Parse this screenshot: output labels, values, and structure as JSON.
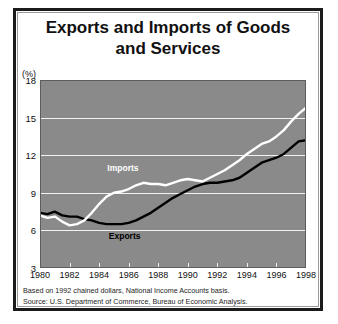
{
  "title": {
    "line1": "Exports and Imports of Goods",
    "line2": "and Services"
  },
  "axis": {
    "unit_label": "(%)",
    "y_ticks": [
      "3",
      "6",
      "9",
      "12",
      "15",
      "18"
    ],
    "x_ticks": [
      "1980",
      "1982",
      "1984",
      "1986",
      "1988",
      "1990",
      "1992",
      "1994",
      "1996",
      "1998"
    ]
  },
  "labels": {
    "imports": "Imports",
    "exports": "Exports"
  },
  "footnotes": [
    "Based on 1992 chained dollars, National Income Accounts basis.",
    "Source: U.S. Department of Commerce, Bureau of Economic Analysis."
  ],
  "colors": {
    "plot_background": "#8a8a8a",
    "gridline": "#f2f2f2",
    "imports_line": "#ffffff",
    "exports_line": "#000000",
    "frame": "#1b1b1b",
    "text": "#111111"
  },
  "chart_data": {
    "type": "line",
    "title": "Exports and Imports of Goods and Services",
    "xlabel": "",
    "ylabel": "(%)",
    "xlim": [
      1980,
      1998
    ],
    "ylim": [
      3,
      18
    ],
    "grid": true,
    "legend": "inline-annotations",
    "x": [
      1980,
      1980.5,
      1981,
      1981.5,
      1982,
      1982.5,
      1983,
      1983.5,
      1984,
      1984.5,
      1985,
      1985.5,
      1986,
      1986.5,
      1987,
      1987.5,
      1988,
      1988.5,
      1989,
      1989.5,
      1990,
      1990.5,
      1991,
      1991.5,
      1992,
      1992.5,
      1993,
      1993.5,
      1994,
      1994.5,
      1995,
      1995.5,
      1996,
      1996.5,
      1997,
      1997.5,
      1998
    ],
    "series": [
      {
        "name": "Exports",
        "color": "#000000",
        "values": [
          7.4,
          7.3,
          7.5,
          7.2,
          7.1,
          7.1,
          6.9,
          6.8,
          6.6,
          6.5,
          6.5,
          6.5,
          6.6,
          6.8,
          7.1,
          7.4,
          7.8,
          8.2,
          8.6,
          8.9,
          9.2,
          9.5,
          9.7,
          9.8,
          9.8,
          9.9,
          10.0,
          10.2,
          10.6,
          11.0,
          11.4,
          11.6,
          11.8,
          12.1,
          12.6,
          13.1,
          13.2
        ]
      },
      {
        "name": "Imports",
        "color": "#ffffff",
        "values": [
          7.2,
          7.0,
          7.1,
          6.7,
          6.4,
          6.5,
          6.8,
          7.4,
          8.1,
          8.7,
          9.0,
          9.1,
          9.3,
          9.6,
          9.8,
          9.7,
          9.7,
          9.6,
          9.8,
          10.0,
          10.1,
          10.0,
          9.9,
          10.2,
          10.5,
          10.8,
          11.2,
          11.6,
          12.1,
          12.5,
          12.9,
          13.1,
          13.5,
          14.0,
          14.7,
          15.3,
          15.8
        ]
      }
    ]
  }
}
